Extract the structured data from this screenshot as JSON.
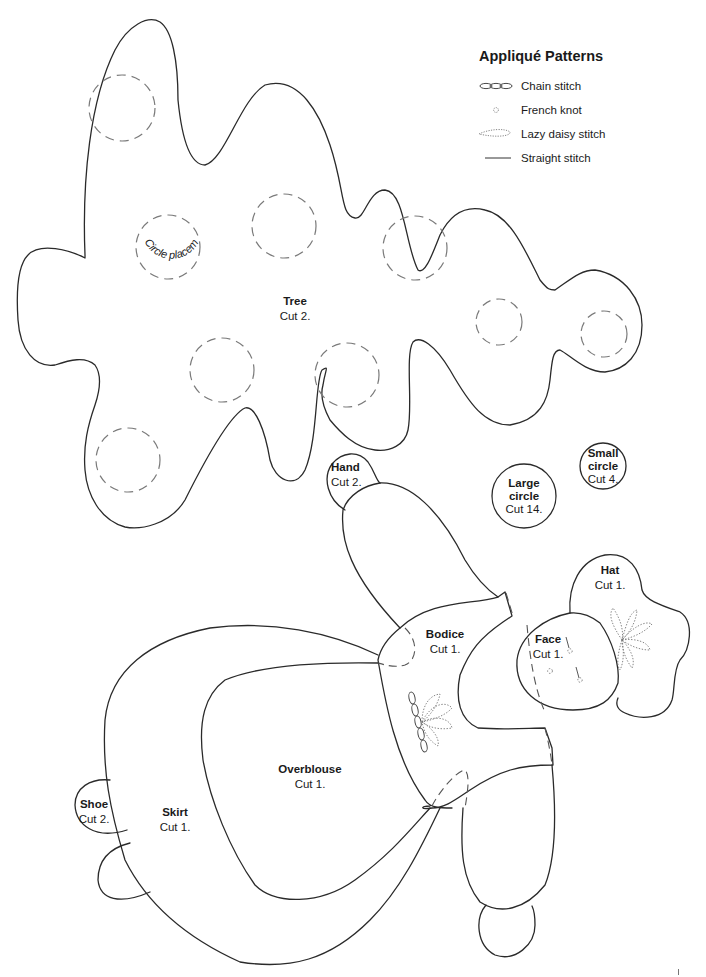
{
  "legend": {
    "title": "Appliqué Patterns",
    "items": [
      {
        "icon": "chain-stitch-icon",
        "label": "Chain stitch"
      },
      {
        "icon": "french-knot-icon",
        "label": "French knot"
      },
      {
        "icon": "lazy-daisy-stitch-icon",
        "label": "Lazy daisy stitch"
      },
      {
        "icon": "straight-stitch-icon",
        "label": "Straight stitch"
      }
    ]
  },
  "pieces": {
    "tree": {
      "name": "Tree",
      "cut": "Cut 2."
    },
    "circle_placement": {
      "text": "Circle placement"
    },
    "hand": {
      "name": "Hand",
      "cut": "Cut 2."
    },
    "large_circle": {
      "name": "Large circle",
      "name_line1": "Large",
      "name_line2": "circle",
      "cut": "Cut 14."
    },
    "small_circle": {
      "name": "Small circle",
      "name_line1": "Small",
      "name_line2": "circle",
      "cut": "Cut 4."
    },
    "hat": {
      "name": "Hat",
      "cut": "Cut 1."
    },
    "bodice": {
      "name": "Bodice",
      "cut": "Cut 1."
    },
    "face": {
      "name": "Face",
      "cut": "Cut 1."
    },
    "overblouse": {
      "name": "Overblouse",
      "cut": "Cut 1."
    },
    "skirt": {
      "name": "Skirt",
      "cut": "Cut 1."
    },
    "shoe": {
      "name": "Shoe",
      "cut": "Cut 2."
    }
  },
  "colors": {
    "outline": "#2a2a2a",
    "placement_dash": "#7a7a7a",
    "background": "#ffffff"
  }
}
